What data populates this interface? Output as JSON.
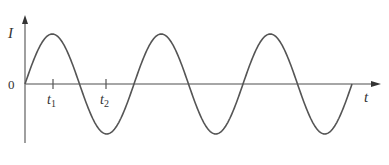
{
  "chart_data": {
    "type": "line",
    "title": "",
    "xlabel": "t",
    "ylabel": "I",
    "origin_label": "0",
    "x_ticks": [
      {
        "label": "t",
        "subscript": "1",
        "position": 1
      },
      {
        "label": "t",
        "subscript": "2",
        "position": 3
      }
    ],
    "series": [
      {
        "name": "I(t)",
        "function": "sine",
        "cycles": 3,
        "start_phase": 0,
        "amplitude": 1
      }
    ],
    "grid": false,
    "legend": "none",
    "colors": {
      "curve": "#555555",
      "axis": "#888888",
      "text": "#333333"
    }
  },
  "labels": {
    "y_axis": "I",
    "x_axis": "t",
    "origin": "0",
    "t1": "t",
    "t1_sub": "1",
    "t2": "t",
    "t2_sub": "2"
  }
}
